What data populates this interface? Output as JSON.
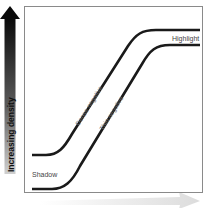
{
  "diagram": {
    "y_axis": {
      "label": "Increasing density",
      "arrow_gradient_top": "#111111",
      "arrow_gradient_bottom": "#c8c8c8"
    },
    "x_axis": {
      "label": "",
      "arrow_color": "#e6e6e6"
    },
    "frame": {
      "border_color": "#8a8a8a"
    },
    "curves": [
      {
        "name": "dense-negative",
        "label": "Dense negative",
        "color": "#1a1a1a"
      },
      {
        "name": "thin-negative",
        "label": "Thin negative",
        "color": "#1a1a1a"
      }
    ],
    "annotations": {
      "highlight": "Highlight",
      "shadow": "Shadow"
    },
    "label_color": "#555555"
  }
}
